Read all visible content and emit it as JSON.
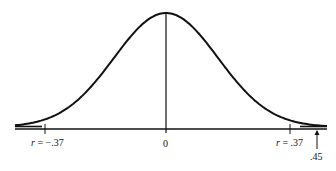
{
  "chart_data": {
    "type": "line",
    "title": "",
    "xlabel": "",
    "ylabel": "",
    "series": [
      {
        "name": "sampling distribution of r",
        "shape": "normal curve",
        "mean": 0,
        "x_range": [
          -0.45,
          0.45
        ]
      }
    ],
    "x_ticks": [
      {
        "value": -0.37,
        "label": "r = -.37"
      },
      {
        "value": 0,
        "label": "0"
      },
      {
        "value": 0.37,
        "label": "r = .37"
      }
    ],
    "annotations": [
      {
        "value": 0.45,
        "label": ".45",
        "type": "arrow-up"
      }
    ],
    "grid": false,
    "legend": null
  },
  "labels": {
    "neg_r_prefix": "r",
    "neg_r_value": " = −.37",
    "zero": "0",
    "pos_r_prefix": "r",
    "pos_r_value": " = .37",
    "arrow_value": ".45"
  },
  "colors": {
    "ink": "#111111",
    "background": "#ffffff"
  }
}
